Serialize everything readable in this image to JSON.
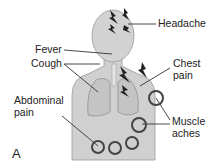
{
  "figure": {
    "panel_label": "A",
    "labels": {
      "headache": "Headache",
      "fever": "Fever",
      "cough": "Cough",
      "chest_pain_1": "Chest",
      "chest_pain_2": "pain",
      "abdominal_pain_1": "Abdominal",
      "abdominal_pain_2": "pain",
      "muscle_aches_1": "Muscle",
      "muscle_aches_2": "aches"
    },
    "colors": {
      "body": "#cfcfcf",
      "outline": "#9a9a9a",
      "lines": "#333333",
      "circles": "#444444"
    }
  }
}
